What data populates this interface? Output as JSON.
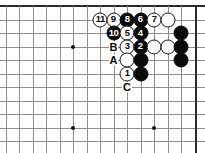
{
  "figure": {
    "type": "go-board-diagram",
    "width": 205,
    "height": 153,
    "background_color": "#ffffff",
    "line_color": "#8e8e8e",
    "edge_line_color": "#2b2b2b",
    "black_stone_color": "#0a0a0a",
    "white_stone_color": "#ffffff"
  },
  "grid": {
    "origin_x": 5.5,
    "origin_y": 6,
    "spacing_x": 13.5,
    "spacing_y": 13.5,
    "columns": 15,
    "rows": 11,
    "top_edge_is_board_edge": true,
    "right_edge_is_board_edge": true
  },
  "star_points": [
    {
      "col": 5,
      "row": 3
    },
    {
      "col": 5,
      "row": 9
    },
    {
      "col": 11,
      "row": 9
    }
  ],
  "stones": [
    {
      "col": 7,
      "row": 1,
      "color": "white",
      "label": "11"
    },
    {
      "col": 8,
      "row": 1,
      "color": "white",
      "label": "9"
    },
    {
      "col": 9,
      "row": 1,
      "color": "black",
      "label": "8"
    },
    {
      "col": 10,
      "row": 1,
      "color": "black",
      "label": "6"
    },
    {
      "col": 11,
      "row": 1,
      "color": "white",
      "label": "7"
    },
    {
      "col": 12,
      "row": 1,
      "color": "white",
      "label": ""
    },
    {
      "col": 8,
      "row": 2,
      "color": "black",
      "label": "10"
    },
    {
      "col": 9,
      "row": 2,
      "color": "white",
      "label": "5"
    },
    {
      "col": 10,
      "row": 2,
      "color": "black",
      "label": "4"
    },
    {
      "col": 13,
      "row": 2,
      "color": "black",
      "label": ""
    },
    {
      "col": 9,
      "row": 3,
      "color": "white",
      "label": "3"
    },
    {
      "col": 10,
      "row": 3,
      "color": "black",
      "label": "2"
    },
    {
      "col": 11,
      "row": 3,
      "color": "white",
      "label": ""
    },
    {
      "col": 12,
      "row": 3,
      "color": "white",
      "label": ""
    },
    {
      "col": 13,
      "row": 3,
      "color": "black",
      "label": ""
    },
    {
      "col": 9,
      "row": 4,
      "color": "white",
      "label": ""
    },
    {
      "col": 10,
      "row": 4,
      "color": "black",
      "label": ""
    },
    {
      "col": 13,
      "row": 4,
      "color": "black",
      "label": ""
    },
    {
      "col": 9,
      "row": 5,
      "color": "white",
      "label": "1"
    },
    {
      "col": 10,
      "row": 5,
      "color": "black",
      "label": ""
    }
  ],
  "point_labels": [
    {
      "col": 8,
      "row": 3,
      "text": "B"
    },
    {
      "col": 8,
      "row": 4,
      "text": "A"
    },
    {
      "col": 9,
      "row": 6,
      "text": "C"
    }
  ]
}
